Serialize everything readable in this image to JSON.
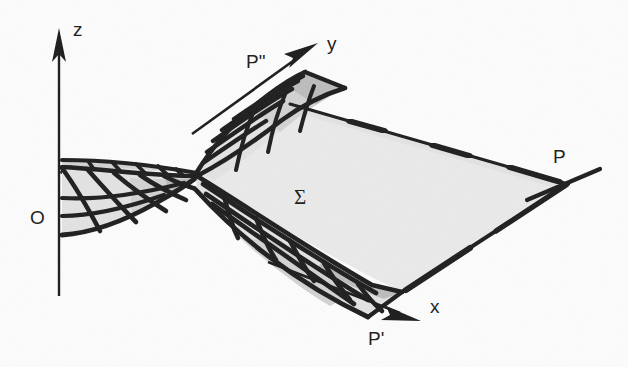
{
  "figure": {
    "background_color": "#fdfdfd",
    "ink_color": "#1a1a1a"
  },
  "labels": {
    "z_axis": "z",
    "y_axis": "y",
    "x_axis": "x",
    "origin": "O",
    "surface": "Σ",
    "point_p": "P",
    "point_p_prime": "P'",
    "point_p_double_prime": "P\""
  },
  "label_positions": {
    "z_axis": {
      "x": 73,
      "y": 36
    },
    "y_axis": {
      "x": 327,
      "y": 50
    },
    "x_axis": {
      "x": 430,
      "y": 313
    },
    "origin": {
      "x": 30,
      "y": 224
    },
    "surface": {
      "x": 294,
      "y": 204
    },
    "point_p": {
      "x": 553,
      "y": 163
    },
    "point_p_prime": {
      "x": 368,
      "y": 345
    },
    "point_p_double_prime": {
      "x": 246,
      "y": 68
    }
  },
  "axes": [
    {
      "name": "z-axis",
      "from": {
        "x": 59,
        "y": 296
      },
      "to": {
        "x": 59,
        "y": 44
      },
      "arrow": true
    },
    {
      "name": "y-axis",
      "from": {
        "x": 196,
        "y": 131
      },
      "to": {
        "x": 318,
        "y": 43
      },
      "arrow": true
    },
    {
      "name": "x-axis",
      "from": {
        "x": 268,
        "y": 262
      },
      "to": {
        "x": 421,
        "y": 321
      },
      "arrow": true
    }
  ],
  "tangent_line_p": {
    "name": "tangent-line-through-P",
    "from": {
      "x": 527,
      "y": 200
    },
    "to": {
      "x": 600,
      "y": 169
    }
  },
  "colors": {
    "surface_fill": "#eaeaea",
    "flap_light": "#e3e3e3",
    "flap_mid": "#d2d2d2",
    "flap_dark": "#bcbcbc",
    "outline": "#1b1b1b",
    "watermark": "#e9e9e9"
  },
  "watermark": {
    "line1": "reproducing the text",
    "line2": "of the corresponding edition"
  },
  "geometry_notes": {
    "saddle_center": {
      "x": 197,
      "y": 172
    },
    "shape": "hyperbolic-paraboloid-with-four-hatched-flaps"
  }
}
